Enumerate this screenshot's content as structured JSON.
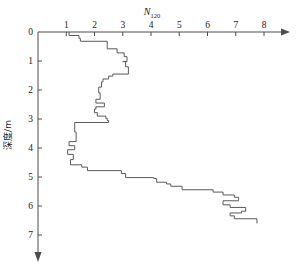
{
  "chart_data": {
    "type": "line",
    "title": "N120",
    "title_base": "N",
    "title_sub": "120",
    "xlabel": "N120",
    "ylabel": "深度/m",
    "ylabel_chars": [
      "深",
      "度",
      "/",
      "m"
    ],
    "xlim": [
      0,
      8.6
    ],
    "ylim": [
      0,
      7.4
    ],
    "x_ticks": [
      1,
      2,
      3,
      4,
      5,
      6,
      7,
      8
    ],
    "x_tick_labels": [
      "1",
      "2",
      "3",
      "4",
      "5",
      "6",
      "7",
      "8"
    ],
    "y_ticks": [
      0,
      1,
      2,
      3,
      4,
      5,
      6,
      7
    ],
    "y_tick_labels": [
      "0",
      "1",
      "2",
      "3",
      "4",
      "5",
      "6",
      "7"
    ],
    "grid": false,
    "legend": false,
    "x_axis_position": "top",
    "y_axis_direction": "down",
    "x_axis_arrow": true,
    "y_axis_arrow": true,
    "series": [
      {
        "name": "N120 blow count",
        "style": "step",
        "color": "#5a5a5a",
        "x": [
          1.1,
          1.1,
          1.45,
          1.45,
          1.5,
          1.5,
          2.45,
          2.45,
          2.45,
          2.55,
          2.8,
          2.8,
          2.95,
          3.05,
          3.05,
          3.15,
          3.15,
          3.0,
          3.1,
          3.1,
          3.2,
          3.2,
          2.65,
          2.65,
          2.5,
          2.5,
          2.3,
          2.3,
          2.25,
          2.25,
          2.15,
          2.15,
          2.2,
          2.2,
          2.05,
          2.05,
          2.35,
          2.35,
          2.05,
          2.05,
          2.0,
          2.0,
          2.1,
          2.1,
          2.4,
          2.4,
          2.45,
          2.45,
          2.5,
          2.5,
          1.3,
          1.3,
          1.35,
          1.35,
          1.1,
          1.1,
          1.3,
          1.3,
          1.05,
          1.05,
          1.25,
          1.25,
          1.15,
          1.15,
          1.55,
          1.55,
          1.75,
          1.75,
          2.95,
          2.95,
          3.1,
          3.1,
          4.1,
          4.1,
          4.2,
          4.2,
          4.55,
          4.55,
          4.7,
          4.7,
          5.1,
          5.1,
          6.2,
          6.2,
          6.55,
          6.55,
          6.95,
          6.95,
          7.1,
          7.1,
          6.55,
          6.55,
          6.8,
          6.8,
          7.35,
          7.35,
          7.2,
          7.2,
          6.8,
          6.8,
          6.95,
          6.95,
          7.75,
          7.75
        ],
        "y": [
          0.0,
          0.12,
          0.12,
          0.22,
          0.22,
          0.32,
          0.32,
          0.48,
          0.58,
          0.58,
          0.58,
          0.72,
          0.72,
          0.72,
          0.85,
          0.85,
          1.02,
          1.02,
          1.02,
          1.2,
          1.2,
          1.45,
          1.45,
          1.52,
          1.52,
          1.62,
          1.62,
          1.72,
          1.72,
          1.9,
          1.9,
          2.1,
          2.1,
          2.32,
          2.32,
          2.45,
          2.45,
          2.58,
          2.58,
          2.66,
          2.66,
          2.78,
          2.78,
          2.9,
          2.9,
          2.98,
          2.98,
          3.05,
          3.05,
          3.12,
          3.12,
          3.45,
          3.45,
          3.78,
          3.78,
          3.92,
          3.92,
          4.06,
          4.06,
          4.22,
          4.22,
          4.4,
          4.4,
          4.58,
          4.58,
          4.66,
          4.66,
          4.78,
          4.78,
          4.88,
          4.88,
          5.02,
          5.02,
          5.05,
          5.05,
          5.18,
          5.18,
          5.24,
          5.24,
          5.32,
          5.32,
          5.44,
          5.44,
          5.52,
          5.52,
          5.62,
          5.62,
          5.7,
          5.7,
          5.82,
          5.82,
          5.96,
          5.96,
          6.05,
          6.05,
          6.18,
          6.18,
          6.24,
          6.24,
          6.34,
          6.34,
          6.44,
          6.44,
          6.6
        ]
      }
    ]
  },
  "geometry": {
    "origin_x": 38,
    "origin_y": 32,
    "px_per_x_unit": 28.25,
    "px_per_y_unit": 29.0
  }
}
